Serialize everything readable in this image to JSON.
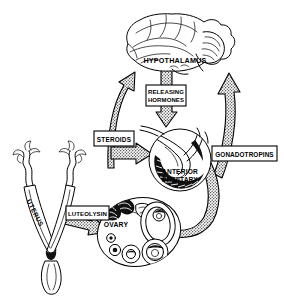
{
  "figure": {
    "background_color": "#ffffff",
    "ink_color": "#000000",
    "width": 284,
    "height": 299
  },
  "organs": {
    "brain": {
      "name": "brain",
      "label": "HYPOTHALAMUS",
      "label_x": 175,
      "label_y": 63
    },
    "pituitary": {
      "name": "anterior-pituitary",
      "label_line1": "ANTERIOR",
      "label_line2": "PITUITARY",
      "label_x": 180,
      "label_y": 174
    },
    "ovary": {
      "name": "ovary",
      "label": "OVARY",
      "label_x": 116,
      "label_y": 227
    },
    "uterus": {
      "name": "uterus",
      "label": "UTERUS",
      "label_x": 33,
      "label_y": 214
    }
  },
  "hormone_boxes": [
    {
      "id": "releasing-hormones",
      "line1": "RELEASING",
      "line2": "HORMONES",
      "x": 146,
      "y": 85,
      "width": 40,
      "height": 21,
      "lines": 2
    },
    {
      "id": "steroids",
      "line1": "STEROIDS",
      "line2": "",
      "x": 94,
      "y": 131,
      "width": 40,
      "height": 15,
      "lines": 1
    },
    {
      "id": "gonadotropins",
      "line1": "GONADOTROPINS",
      "line2": "",
      "x": 212,
      "y": 146,
      "width": 65,
      "height": 15,
      "lines": 1
    },
    {
      "id": "luteolysin",
      "line1": "LUTEOLYSIN",
      "line2": "",
      "x": 66,
      "y": 206,
      "width": 43,
      "height": 14,
      "lines": 1
    }
  ],
  "arrows": [
    {
      "id": "releasing-hormones-arrow",
      "from": "hypothalamus",
      "to": "anterior-pituitary",
      "direction": "down",
      "style": "stippled"
    },
    {
      "id": "steroids-feedback-arrow",
      "from": "ovary",
      "to": "hypothalamus",
      "direction": "up",
      "style": "stippled"
    },
    {
      "id": "steroids-to-pituitary-arrow",
      "from": "steroids",
      "to": "anterior-pituitary",
      "direction": "right",
      "style": "stippled"
    },
    {
      "id": "gonadotropins-arrow",
      "from": "anterior-pituitary",
      "to": "ovary",
      "direction": "down-left-curve",
      "style": "stippled"
    },
    {
      "id": "ovary-to-hypothalamus-arrow",
      "from": "ovary",
      "to": "hypothalamus",
      "direction": "up-curve",
      "style": "stippled"
    },
    {
      "id": "luteolysin-arrow",
      "from": "uterus",
      "to": "ovary",
      "direction": "right",
      "style": "stippled"
    }
  ]
}
